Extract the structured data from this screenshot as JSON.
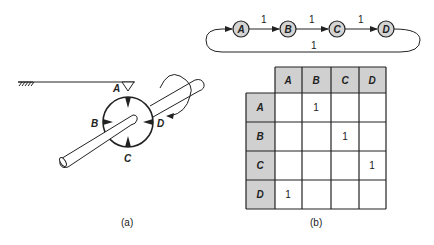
{
  "figure_a": {
    "caption": "(a)",
    "points": [
      {
        "id": "A",
        "label": "A"
      },
      {
        "id": "B",
        "label": "B"
      },
      {
        "id": "C",
        "label": "C"
      },
      {
        "id": "D",
        "label": "D"
      }
    ]
  },
  "figure_b": {
    "caption": "(b)",
    "graph": {
      "nodes": [
        "A",
        "B",
        "C",
        "D"
      ],
      "edges": [
        {
          "from": "A",
          "to": "B",
          "weight": "1"
        },
        {
          "from": "B",
          "to": "C",
          "weight": "1"
        },
        {
          "from": "C",
          "to": "D",
          "weight": "1"
        },
        {
          "from": "D",
          "to": "A",
          "weight": "1"
        }
      ]
    },
    "matrix": {
      "col_headers": [
        "A",
        "B",
        "C",
        "D"
      ],
      "rows": [
        {
          "header": "A",
          "cells": [
            "",
            "1",
            "",
            ""
          ]
        },
        {
          "header": "B",
          "cells": [
            "",
            "",
            "1",
            ""
          ]
        },
        {
          "header": "C",
          "cells": [
            "",
            "",
            "",
            "1"
          ]
        },
        {
          "header": "D",
          "cells": [
            "1",
            "",
            "",
            ""
          ]
        }
      ]
    }
  },
  "colors": {
    "stroke": "#222222",
    "node_fill": "#d4d4d4",
    "header_fill": "#d0d0d0"
  }
}
